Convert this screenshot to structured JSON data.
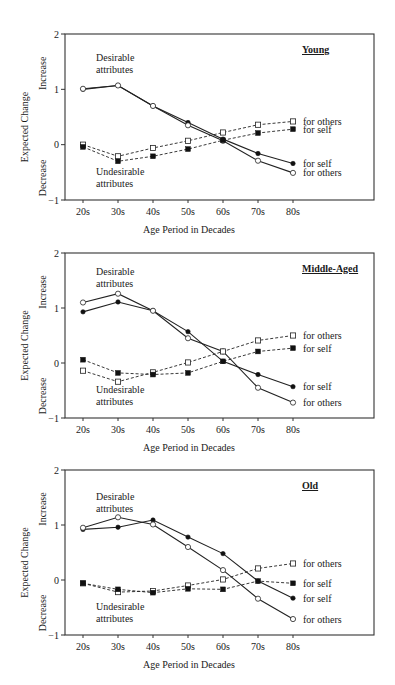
{
  "figure": {
    "x_axis_label": "Age Period in Decades",
    "y_axis_label": "Expected Change",
    "y_increase_label": "Increase",
    "y_decrease_label": "Decrease",
    "desirable_label_line1": "Desirable",
    "desirable_label_line2": "attributes",
    "undesirable_label_line1": "Undesirable",
    "undesirable_label_line2": "attributes"
  },
  "chart_data": [
    {
      "type": "line",
      "title": "Young",
      "xlabel": "Age Period in Decades",
      "ylabel": "Expected Change",
      "categories": [
        "20s",
        "30s",
        "40s",
        "50s",
        "60s",
        "70s",
        "80s"
      ],
      "yticks": [
        "2",
        "1",
        "0",
        "−1"
      ],
      "ylim": [
        -1,
        2
      ],
      "grid": false,
      "legend_position": "right end-labels",
      "series": [
        {
          "name": "Desirable attributes for self",
          "group": "desirable",
          "marker": "filled-circle",
          "line": "solid",
          "end_label": "for self",
          "values": [
            1.0,
            1.07,
            0.7,
            0.4,
            0.1,
            -0.16,
            -0.34
          ]
        },
        {
          "name": "Desirable attributes for others",
          "group": "desirable",
          "marker": "open-circle",
          "line": "solid",
          "end_label": "for others",
          "values": [
            1.01,
            1.07,
            0.7,
            0.35,
            0.07,
            -0.29,
            -0.51
          ]
        },
        {
          "name": "Undesirable attributes for others",
          "group": "undesirable",
          "marker": "open-square",
          "line": "dashed",
          "end_label": "for others",
          "values": [
            0.0,
            -0.21,
            -0.06,
            0.07,
            0.22,
            0.36,
            0.42
          ]
        },
        {
          "name": "Undesirable attributes for self",
          "group": "undesirable",
          "marker": "filled-square",
          "line": "dashed",
          "end_label": "for self",
          "values": [
            -0.04,
            -0.3,
            -0.21,
            -0.08,
            0.08,
            0.21,
            0.28
          ]
        }
      ]
    },
    {
      "type": "line",
      "title": "Middle-Aged",
      "xlabel": "Age Period in Decades",
      "ylabel": "Expected Change",
      "categories": [
        "20s",
        "30s",
        "40s",
        "50s",
        "60s",
        "70s",
        "80s"
      ],
      "yticks": [
        "2",
        "1",
        "0",
        "−1"
      ],
      "ylim": [
        -1,
        2
      ],
      "grid": false,
      "legend_position": "right end-labels",
      "series": [
        {
          "name": "Desirable attributes for self",
          "group": "desirable",
          "marker": "filled-circle",
          "line": "solid",
          "end_label": "for self",
          "values": [
            0.93,
            1.11,
            0.95,
            0.57,
            0.03,
            -0.21,
            -0.43
          ]
        },
        {
          "name": "Desirable attributes for others",
          "group": "desirable",
          "marker": "open-circle",
          "line": "solid",
          "end_label": "for others",
          "values": [
            1.1,
            1.26,
            0.95,
            0.45,
            0.21,
            -0.45,
            -0.72
          ]
        },
        {
          "name": "Undesirable attributes for others",
          "group": "undesirable",
          "marker": "open-square",
          "line": "dashed",
          "end_label": "for others",
          "values": [
            -0.14,
            -0.34,
            -0.17,
            0.01,
            0.21,
            0.41,
            0.5
          ]
        },
        {
          "name": "Undesirable attributes for self",
          "group": "undesirable",
          "marker": "filled-square",
          "line": "dashed",
          "end_label": "for self",
          "values": [
            0.06,
            -0.18,
            -0.21,
            -0.18,
            0.03,
            0.21,
            0.27
          ]
        }
      ]
    },
    {
      "type": "line",
      "title": "Old",
      "xlabel": "Age Period in Decades",
      "ylabel": "Expected Change",
      "categories": [
        "20s",
        "30s",
        "40s",
        "50s",
        "60s",
        "70s",
        "80s"
      ],
      "yticks": [
        "2",
        "1",
        "0",
        "−1"
      ],
      "ylim": [
        -1,
        2
      ],
      "grid": false,
      "legend_position": "right end-labels",
      "series": [
        {
          "name": "Desirable attributes for self",
          "group": "desirable",
          "marker": "filled-circle",
          "line": "solid",
          "end_label": "for self",
          "values": [
            0.92,
            0.96,
            1.09,
            0.78,
            0.48,
            -0.02,
            -0.33
          ]
        },
        {
          "name": "Desirable attributes for others",
          "group": "desirable",
          "marker": "open-circle",
          "line": "solid",
          "end_label": "for others",
          "values": [
            0.95,
            1.14,
            1.01,
            0.6,
            0.18,
            -0.34,
            -0.71
          ]
        },
        {
          "name": "Undesirable attributes for others",
          "group": "undesirable",
          "marker": "open-square",
          "line": "dashed",
          "end_label": "for others",
          "values": [
            -0.06,
            -0.22,
            -0.2,
            -0.1,
            0.01,
            0.21,
            0.3
          ]
        },
        {
          "name": "Undesirable attributes for self",
          "group": "undesirable",
          "marker": "filled-square",
          "line": "dashed",
          "end_label": "for self",
          "values": [
            -0.06,
            -0.17,
            -0.23,
            -0.16,
            -0.17,
            -0.02,
            -0.06
          ]
        }
      ]
    }
  ]
}
